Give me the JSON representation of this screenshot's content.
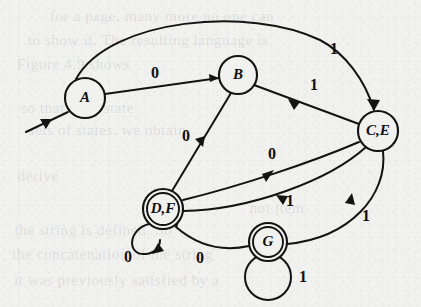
{
  "figure": {
    "type": "finite-state-automaton-diagram",
    "background_color": "#f1f1f0",
    "ink_color": "#131313",
    "alphabet": [
      "0",
      "1"
    ]
  },
  "nodes": [
    {
      "id": "A",
      "label": "A",
      "x": 85,
      "y": 98,
      "r": 20,
      "accepting": false,
      "start": true
    },
    {
      "id": "B",
      "label": "B",
      "x": 238,
      "y": 75,
      "r": 19,
      "accepting": false,
      "start": false
    },
    {
      "id": "CE",
      "label": "C,E",
      "x": 378,
      "y": 131,
      "r": 20,
      "accepting": false,
      "start": false
    },
    {
      "id": "DF",
      "label": "D,F",
      "x": 163,
      "y": 209,
      "r": 20,
      "accepting": true,
      "start": false
    },
    {
      "id": "G",
      "label": "G",
      "x": 268,
      "y": 242,
      "r": 19,
      "accepting": true,
      "start": false
    }
  ],
  "start_arrow": {
    "name": "start-arrow",
    "from_x": 26,
    "from_y": 132,
    "to_x": 69,
    "to_y": 111
  },
  "edges": [
    {
      "id": "A-B",
      "from": "A",
      "to": "B",
      "label": "0",
      "label_x": 155,
      "label_y": 74,
      "kind": "straight"
    },
    {
      "id": "A-CE",
      "from": "A",
      "to": "CE",
      "label": "1",
      "label_x": 334,
      "label_y": 50,
      "kind": "arc-over"
    },
    {
      "id": "B-CE",
      "from": "B",
      "to": "CE",
      "label": "1",
      "label_x": 314,
      "label_y": 86,
      "kind": "straight"
    },
    {
      "id": "B-DF",
      "from": "B",
      "to": "DF",
      "label": "0",
      "label_x": 186,
      "label_y": 137,
      "kind": "straight"
    },
    {
      "id": "CE-DF",
      "from": "CE",
      "to": "DF",
      "label": "0",
      "label_x": 272,
      "label_y": 155,
      "kind": "curve-upper"
    },
    {
      "id": "DF-CE",
      "from": "DF",
      "to": "CE",
      "label": "1",
      "label_x": 290,
      "label_y": 202,
      "kind": "curve-lower"
    },
    {
      "id": "CE-G",
      "from": "CE",
      "to": "G",
      "label": "1",
      "label_x": 366,
      "label_y": 217,
      "kind": "curve-right"
    },
    {
      "id": "G-DF",
      "from": "G",
      "to": "DF",
      "label": "0",
      "label_x": 200,
      "label_y": 259,
      "kind": "curve-bottom"
    },
    {
      "id": "DF-DF",
      "from": "DF",
      "to": "DF",
      "label": "0",
      "label_x": 128,
      "label_y": 258,
      "kind": "self-loop-left"
    },
    {
      "id": "G-G",
      "from": "G",
      "to": "G",
      "label": "1",
      "label_x": 303,
      "label_y": 278,
      "kind": "self-loop-below"
    }
  ],
  "ghost_text": [
    {
      "text": "for a page, many more no one can",
      "x": 52,
      "y": 8,
      "size": 15
    },
    {
      "text": "to show it. The resulting language is",
      "x": 30,
      "y": 32,
      "size": 15
    },
    {
      "text": "Figure 4.9 shows",
      "x": 18,
      "y": 56,
      "size": 15
    },
    {
      "text": "so that each state",
      "x": 22,
      "y": 100,
      "size": 15
    },
    {
      "text": "sets of states, we obtain",
      "x": 30,
      "y": 122,
      "size": 15
    },
    {
      "text": "derive",
      "x": 18,
      "y": 168,
      "size": 15
    },
    {
      "text": "not item",
      "x": 250,
      "y": 200,
      "size": 15
    },
    {
      "text": "the string is defined. So",
      "x": 16,
      "y": 222,
      "size": 15
    },
    {
      "text": "the concatenation of the string",
      "x": 14,
      "y": 246,
      "size": 15
    },
    {
      "text": "it was previously satisfied by a",
      "x": 16,
      "y": 272,
      "size": 15
    }
  ]
}
